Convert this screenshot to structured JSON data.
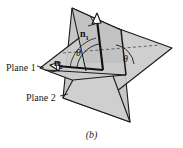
{
  "figure": {
    "caption": "(b)",
    "labels": {
      "plane1": "Plane 1",
      "plane2": "Plane 2",
      "normal1_base": "n",
      "normal1_sub": "1",
      "normal2_base": "n",
      "normal2_sub": "2",
      "angle_left": "θ",
      "angle_right": "θ"
    },
    "colors": {
      "plane_fill": "#c9c9c9",
      "plane_fill_light": "#d8d8d8",
      "outline": "#1a1a1a",
      "vector": "#111111",
      "background": "#ffffff",
      "dashed": "#4a4a4a"
    },
    "elements": [
      "plane-1-horizontal-parallelogram",
      "plane-2-tilted-parallelogram",
      "normal-vector-n1",
      "normal-vector-n2",
      "angle-arc-left",
      "angle-arc-right",
      "right-angle-mark-n1",
      "right-angle-mark-n2",
      "dashed-intersection-line",
      "leader-line-plane1",
      "leader-line-plane2"
    ]
  }
}
